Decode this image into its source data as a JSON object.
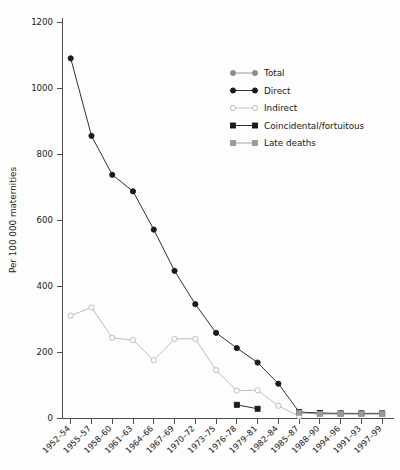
{
  "chart_data": {
    "type": "line",
    "title": "",
    "xlabel": "",
    "ylabel": "Per 100 000 maternities",
    "ylim": [
      0,
      1200
    ],
    "yticks": [
      0,
      200,
      400,
      600,
      800,
      1000,
      1200
    ],
    "grid": false,
    "legend_position": "top-right",
    "categories": [
      "1952–54",
      "1955–57",
      "1958–60",
      "1961–63",
      "1964–66",
      "1967–69",
      "1970–72",
      "1973–75",
      "1976–78",
      "1979–81",
      "1982–84",
      "1985–87",
      "1988–90",
      "1994–96",
      "1991–93",
      "1997–99"
    ],
    "series": [
      {
        "name": "Total",
        "color": "#8c8c8c",
        "marker": "circle",
        "fill": "#8c8c8c",
        "values": [
          null,
          null,
          null,
          null,
          null,
          null,
          null,
          null,
          null,
          null,
          null,
          18,
          14,
          13,
          13,
          13
        ]
      },
      {
        "name": "Direct",
        "color": "#1a1a1a",
        "marker": "circle",
        "fill": "#1a1a1a",
        "values": [
          1090,
          855,
          737,
          687,
          571,
          446,
          345,
          258,
          212,
          168,
          104,
          18,
          null,
          null,
          null,
          null
        ]
      },
      {
        "name": "Indirect",
        "color": "#b5b5b5",
        "marker": "circle",
        "fill": "#ffffff",
        "values": [
          310,
          335,
          243,
          236,
          175,
          240,
          240,
          145,
          83,
          84,
          37,
          5,
          null,
          null,
          null,
          null
        ]
      },
      {
        "name": "Coincidental/fortuitous",
        "color": "#1a1a1a",
        "marker": "square",
        "fill": "#1a1a1a",
        "values": [
          null,
          null,
          null,
          null,
          null,
          null,
          null,
          null,
          40,
          28,
          null,
          18,
          15,
          14,
          14,
          14
        ]
      },
      {
        "name": "Late deaths",
        "color": "#9a9a9a",
        "marker": "square",
        "fill": "#9a9a9a",
        "values": [
          null,
          null,
          null,
          null,
          null,
          null,
          null,
          null,
          null,
          null,
          null,
          16,
          12,
          12,
          12,
          12
        ]
      }
    ]
  },
  "legend": {
    "items": [
      {
        "label": "Total"
      },
      {
        "label": "Direct"
      },
      {
        "label": "Indirect"
      },
      {
        "label": "Coincidental/fortuitous"
      },
      {
        "label": "Late deaths"
      }
    ]
  }
}
